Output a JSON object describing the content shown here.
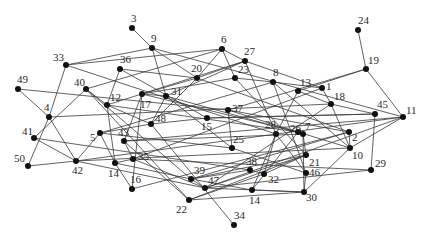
{
  "diagram": {
    "type": "network-graph",
    "colors": {
      "background": "#ffffff",
      "edge": "#3a3a3a",
      "node": "#111111",
      "label": "#2a2a2a"
    },
    "nodes": [
      {
        "id": "3",
        "label": "3",
        "x": 132,
        "y": 28,
        "lx": 131,
        "ly": 22
      },
      {
        "id": "9",
        "label": "9",
        "x": 152,
        "y": 48,
        "lx": 151,
        "ly": 42
      },
      {
        "id": "24",
        "label": "24",
        "x": 358,
        "y": 30,
        "lx": 358,
        "ly": 24
      },
      {
        "id": "19",
        "label": "19",
        "x": 366,
        "y": 69,
        "lx": 368,
        "ly": 64
      },
      {
        "id": "6",
        "label": "6",
        "x": 222,
        "y": 49,
        "lx": 221,
        "ly": 43
      },
      {
        "id": "27",
        "label": "27",
        "x": 245,
        "y": 61,
        "lx": 244,
        "ly": 55
      },
      {
        "id": "33",
        "label": "33",
        "x": 66,
        "y": 65,
        "lx": 53,
        "ly": 61
      },
      {
        "id": "36",
        "label": "36",
        "x": 120,
        "y": 69,
        "lx": 120,
        "ly": 63
      },
      {
        "id": "20",
        "label": "20",
        "x": 197,
        "y": 78,
        "lx": 191,
        "ly": 72
      },
      {
        "id": "23",
        "label": "23",
        "x": 235,
        "y": 78,
        "lx": 238,
        "ly": 73
      },
      {
        "id": "8",
        "label": "8",
        "x": 273,
        "y": 82,
        "lx": 273,
        "ly": 76
      },
      {
        "id": "13",
        "label": "13",
        "x": 298,
        "y": 91,
        "lx": 300,
        "ly": 86
      },
      {
        "id": "1",
        "label": "1",
        "x": 322,
        "y": 88,
        "lx": 326,
        "ly": 90
      },
      {
        "id": "18",
        "label": "18",
        "x": 331,
        "y": 104,
        "lx": 334,
        "ly": 100
      },
      {
        "id": "49",
        "label": "49",
        "x": 18,
        "y": 89,
        "lx": 17,
        "ly": 83
      },
      {
        "id": "40",
        "label": "40",
        "x": 86,
        "y": 89,
        "lx": 74,
        "ly": 86
      },
      {
        "id": "17",
        "label": "17",
        "x": 142,
        "y": 94,
        "lx": 140,
        "ly": 108
      },
      {
        "id": "31",
        "label": "31",
        "x": 166,
        "y": 96,
        "lx": 171,
        "ly": 95
      },
      {
        "id": "12",
        "label": "12",
        "x": 107,
        "y": 105,
        "lx": 110,
        "ly": 101
      },
      {
        "id": "48",
        "label": "48",
        "x": 151,
        "y": 124,
        "lx": 155,
        "ly": 122
      },
      {
        "id": "37",
        "label": "37",
        "x": 228,
        "y": 110,
        "lx": 232,
        "ly": 112
      },
      {
        "id": "45",
        "label": "45",
        "x": 375,
        "y": 114,
        "lx": 377,
        "ly": 108
      },
      {
        "id": "11",
        "label": "11",
        "x": 403,
        "y": 117,
        "lx": 406,
        "ly": 114
      },
      {
        "id": "26",
        "label": "26",
        "x": 298,
        "y": 132,
        "lx": 290,
        "ly": 132
      },
      {
        "id": "4",
        "label": "4",
        "x": 49,
        "y": 117,
        "lx": 44,
        "ly": 111
      },
      {
        "id": "15",
        "label": "15",
        "x": 207,
        "y": 118,
        "lx": 201,
        "ly": 130
      },
      {
        "id": "28",
        "label": "28",
        "x": 276,
        "y": 134,
        "lx": 265,
        "ly": 128
      },
      {
        "id": "7",
        "label": "7",
        "x": 303,
        "y": 134,
        "lx": 305,
        "ly": 130
      },
      {
        "id": "2",
        "label": "2",
        "x": 349,
        "y": 132,
        "lx": 352,
        "ly": 141
      },
      {
        "id": "41",
        "label": "41",
        "x": 34,
        "y": 138,
        "lx": 22,
        "ly": 135
      },
      {
        "id": "5",
        "label": "5",
        "x": 100,
        "y": 133,
        "lx": 90,
        "ly": 141
      },
      {
        "id": "43",
        "label": "43",
        "x": 124,
        "y": 141,
        "lx": 118,
        "ly": 136
      },
      {
        "id": "25",
        "label": "25",
        "x": 232,
        "y": 148,
        "lx": 233,
        "ly": 143
      },
      {
        "id": "10",
        "label": "10",
        "x": 350,
        "y": 148,
        "lx": 352,
        "ly": 159
      },
      {
        "id": "21",
        "label": "21",
        "x": 306,
        "y": 155,
        "lx": 309,
        "ly": 166
      },
      {
        "id": "35",
        "label": "35",
        "x": 133,
        "y": 159,
        "lx": 138,
        "ly": 160
      },
      {
        "id": "14a",
        "label": "14",
        "x": 115,
        "y": 163,
        "lx": 108,
        "ly": 177
      },
      {
        "id": "50",
        "label": "50",
        "x": 28,
        "y": 166,
        "lx": 14,
        "ly": 162
      },
      {
        "id": "42",
        "label": "42",
        "x": 76,
        "y": 161,
        "lx": 72,
        "ly": 174
      },
      {
        "id": "46",
        "label": "46",
        "x": 306,
        "y": 173,
        "lx": 309,
        "ly": 176
      },
      {
        "id": "38",
        "label": "38",
        "x": 250,
        "y": 170,
        "lx": 246,
        "ly": 165
      },
      {
        "id": "32",
        "label": "32",
        "x": 264,
        "y": 174,
        "lx": 268,
        "ly": 183
      },
      {
        "id": "29",
        "label": "29",
        "x": 371,
        "y": 170,
        "lx": 375,
        "ly": 167
      },
      {
        "id": "16",
        "label": "16",
        "x": 132,
        "y": 189,
        "lx": 130,
        "ly": 183
      },
      {
        "id": "39",
        "label": "39",
        "x": 191,
        "y": 179,
        "lx": 194,
        "ly": 174
      },
      {
        "id": "47",
        "label": "47",
        "x": 205,
        "y": 188,
        "lx": 208,
        "ly": 184
      },
      {
        "id": "14b",
        "label": "14",
        "x": 252,
        "y": 190,
        "lx": 249,
        "ly": 204
      },
      {
        "id": "30",
        "label": "30",
        "x": 304,
        "y": 192,
        "lx": 306,
        "ly": 201
      },
      {
        "id": "22",
        "label": "22",
        "x": 189,
        "y": 200,
        "lx": 176,
        "ly": 213
      },
      {
        "id": "34",
        "label": "34",
        "x": 234,
        "y": 225,
        "lx": 234,
        "ly": 219
      }
    ],
    "edges": [
      [
        "3",
        "9"
      ],
      [
        "9",
        "33"
      ],
      [
        "9",
        "20"
      ],
      [
        "9",
        "31"
      ],
      [
        "9",
        "11"
      ],
      [
        "24",
        "19"
      ],
      [
        "19",
        "13"
      ],
      [
        "19",
        "11"
      ],
      [
        "19",
        "37"
      ],
      [
        "6",
        "27"
      ],
      [
        "6",
        "20"
      ],
      [
        "6",
        "23"
      ],
      [
        "6",
        "40"
      ],
      [
        "6",
        "33"
      ],
      [
        "27",
        "20"
      ],
      [
        "27",
        "31"
      ],
      [
        "27",
        "1"
      ],
      [
        "27",
        "12"
      ],
      [
        "27",
        "28"
      ],
      [
        "33",
        "4"
      ],
      [
        "33",
        "28"
      ],
      [
        "36",
        "20"
      ],
      [
        "36",
        "12"
      ],
      [
        "36",
        "15"
      ],
      [
        "20",
        "17"
      ],
      [
        "20",
        "48"
      ],
      [
        "20",
        "2"
      ],
      [
        "23",
        "17"
      ],
      [
        "23",
        "8"
      ],
      [
        "23",
        "21"
      ],
      [
        "8",
        "1"
      ],
      [
        "8",
        "5"
      ],
      [
        "8",
        "46"
      ],
      [
        "8",
        "10"
      ],
      [
        "13",
        "18"
      ],
      [
        "13",
        "28"
      ],
      [
        "1",
        "18"
      ],
      [
        "1",
        "35"
      ],
      [
        "18",
        "45"
      ],
      [
        "18",
        "10"
      ],
      [
        "18",
        "47"
      ],
      [
        "49",
        "4"
      ],
      [
        "49",
        "37"
      ],
      [
        "40",
        "12"
      ],
      [
        "40",
        "39"
      ],
      [
        "40",
        "22"
      ],
      [
        "40",
        "41"
      ],
      [
        "17",
        "31"
      ],
      [
        "17",
        "16"
      ],
      [
        "17",
        "43"
      ],
      [
        "17",
        "26"
      ],
      [
        "31",
        "48"
      ],
      [
        "31",
        "25"
      ],
      [
        "31",
        "7"
      ],
      [
        "12",
        "48"
      ],
      [
        "12",
        "26"
      ],
      [
        "12",
        "14a"
      ],
      [
        "48",
        "15"
      ],
      [
        "48",
        "5"
      ],
      [
        "48",
        "34"
      ],
      [
        "37",
        "25"
      ],
      [
        "37",
        "26"
      ],
      [
        "37",
        "2"
      ],
      [
        "45",
        "29"
      ],
      [
        "45",
        "15"
      ],
      [
        "11",
        "42"
      ],
      [
        "11",
        "47"
      ],
      [
        "11",
        "10"
      ],
      [
        "4",
        "42"
      ],
      [
        "4",
        "50"
      ],
      [
        "4",
        "18"
      ],
      [
        "15",
        "45"
      ],
      [
        "28",
        "32"
      ],
      [
        "28",
        "14b"
      ],
      [
        "28",
        "46"
      ],
      [
        "7",
        "30"
      ],
      [
        "7",
        "21"
      ],
      [
        "7",
        "43"
      ],
      [
        "2",
        "10"
      ],
      [
        "2",
        "39"
      ],
      [
        "41",
        "42"
      ],
      [
        "41",
        "38"
      ],
      [
        "5",
        "42"
      ],
      [
        "5",
        "14a"
      ],
      [
        "43",
        "35"
      ],
      [
        "43",
        "22"
      ],
      [
        "43",
        "11"
      ],
      [
        "25",
        "46"
      ],
      [
        "25",
        "5"
      ],
      [
        "10",
        "30"
      ],
      [
        "10",
        "42"
      ],
      [
        "21",
        "47"
      ],
      [
        "21",
        "39"
      ],
      [
        "35",
        "14a"
      ],
      [
        "35",
        "47"
      ],
      [
        "35",
        "29"
      ],
      [
        "14a",
        "16"
      ],
      [
        "14a",
        "39"
      ],
      [
        "50",
        "42"
      ],
      [
        "42",
        "47"
      ],
      [
        "46",
        "30"
      ],
      [
        "38",
        "32"
      ],
      [
        "38",
        "39"
      ],
      [
        "32",
        "22"
      ],
      [
        "32",
        "21"
      ],
      [
        "29",
        "47"
      ],
      [
        "16",
        "2"
      ],
      [
        "39",
        "47"
      ],
      [
        "39",
        "14b"
      ],
      [
        "47",
        "30"
      ],
      [
        "14b",
        "30"
      ],
      [
        "22",
        "21"
      ],
      [
        "22",
        "30"
      ],
      [
        "26",
        "14b"
      ],
      [
        "26",
        "10"
      ]
    ]
  }
}
